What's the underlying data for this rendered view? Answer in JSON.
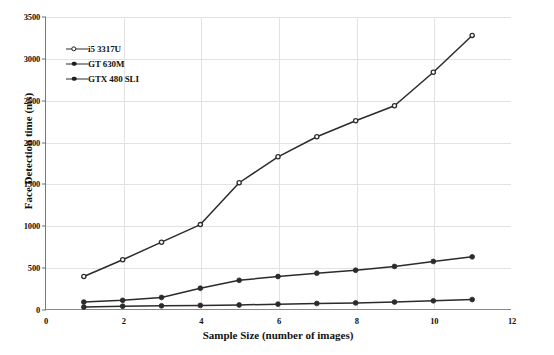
{
  "chart_data": {
    "type": "line",
    "title": "",
    "xlabel": "Sample Size (number of images)",
    "ylabel": "Face Detection time (ms)",
    "xlim": [
      0,
      12
    ],
    "ylim": [
      0,
      3500
    ],
    "xticks": [
      0,
      2,
      4,
      6,
      8,
      10,
      12
    ],
    "yticks": [
      0,
      500,
      1000,
      1500,
      2000,
      2500,
      3000,
      3500
    ],
    "grid": true,
    "legend_position": "upper-left",
    "x": [
      1,
      2,
      3,
      4,
      5,
      6,
      7,
      8,
      9,
      10,
      11
    ],
    "series": [
      {
        "name": "i5 3317U",
        "marker": "open-circle",
        "color": "#2b2b2b",
        "values": [
          400,
          600,
          810,
          1020,
          1520,
          1830,
          2070,
          2260,
          2440,
          2840,
          3280
        ]
      },
      {
        "name": "GT 630M",
        "marker": "filled-circle",
        "color": "#2b2b2b",
        "values": [
          95,
          115,
          150,
          260,
          355,
          400,
          440,
          475,
          520,
          580,
          635
        ]
      },
      {
        "name": "GTX 480 SLI",
        "marker": "filled-circle",
        "color": "#2b2b2b",
        "values": [
          35,
          45,
          50,
          55,
          60,
          70,
          78,
          85,
          95,
          110,
          125
        ]
      }
    ]
  },
  "axes": {
    "x_title": "Sample Size (number of images)",
    "y_title": "Face Detection time (ms)",
    "xticklabels": [
      "0",
      "2",
      "4",
      "6",
      "8",
      "10",
      "12"
    ],
    "yticklabels": [
      "0",
      "500",
      "1000",
      "1500",
      "2000",
      "2500",
      "3000",
      "3500"
    ]
  },
  "legend": {
    "items": [
      {
        "label": "i5 3317U"
      },
      {
        "label": "GT 630M"
      },
      {
        "label": "GTX 480 SLI"
      }
    ]
  },
  "style": {
    "line_color": "#2b2b2b",
    "grid_color": "#e2e2e2",
    "axis_color": "#7a7a7a",
    "background": "#ffffff"
  }
}
